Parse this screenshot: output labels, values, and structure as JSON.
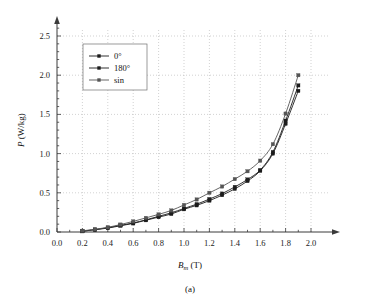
{
  "figure": {
    "caption": "(a)"
  },
  "chart_data": {
    "type": "line",
    "title": "",
    "subtitle": "",
    "xlabel": "Bm (T)",
    "xlabel_base": "B",
    "xlabel_sub": "m",
    "xlabel_unit": "(T)",
    "ylabel": "P (W/kg)",
    "ylabel_base": "P",
    "ylabel_unit": "(W/kg)",
    "xlim": [
      0.0,
      2.1
    ],
    "ylim": [
      0.0,
      2.7
    ],
    "xticks": [
      0.0,
      0.2,
      0.4,
      0.6,
      0.8,
      1.0,
      1.2,
      1.4,
      1.6,
      1.8,
      2.0
    ],
    "xticklabels": [
      "0.0",
      "0.2",
      "0.4",
      "0.6",
      "0.8",
      "1.0",
      "1.2",
      "1.4",
      "1.6",
      "1.8",
      "2.0"
    ],
    "yticks": [
      0.0,
      0.5,
      1.0,
      1.5,
      2.0,
      2.5
    ],
    "yticklabels": [
      "0.0",
      "0.5",
      "1.0",
      "1.5",
      "2.0",
      "2.5"
    ],
    "x_minor_step": 0.1,
    "y_minor_step": 0.1,
    "grid": true,
    "grid_style": "dotted",
    "grid_color": "#b4b4b4",
    "axis_color": "#3a3a3a",
    "axis_arrows": true,
    "legend_position": "upper-left-inside",
    "x": [
      0.2,
      0.3,
      0.4,
      0.5,
      0.6,
      0.7,
      0.8,
      0.9,
      1.0,
      1.1,
      1.2,
      1.3,
      1.4,
      1.5,
      1.6,
      1.7,
      1.8,
      1.9
    ],
    "series": [
      {
        "name": "0°",
        "color": "#1c1c1c",
        "marker": "square",
        "values": [
          0.01,
          0.03,
          0.05,
          0.08,
          0.11,
          0.15,
          0.19,
          0.23,
          0.29,
          0.34,
          0.4,
          0.47,
          0.55,
          0.65,
          0.78,
          1.0,
          1.38,
          1.8
        ]
      },
      {
        "name": "180°",
        "color": "#1c1c1c",
        "marker": "square",
        "values": [
          0.01,
          0.03,
          0.055,
          0.085,
          0.115,
          0.155,
          0.2,
          0.245,
          0.3,
          0.355,
          0.42,
          0.49,
          0.575,
          0.67,
          0.79,
          1.02,
          1.42,
          1.87
        ]
      },
      {
        "name": "sin",
        "color": "#555555",
        "marker": "square",
        "values": [
          0.015,
          0.035,
          0.06,
          0.095,
          0.135,
          0.18,
          0.225,
          0.275,
          0.345,
          0.415,
          0.5,
          0.58,
          0.675,
          0.775,
          0.91,
          1.12,
          1.51,
          2.0
        ]
      }
    ]
  }
}
